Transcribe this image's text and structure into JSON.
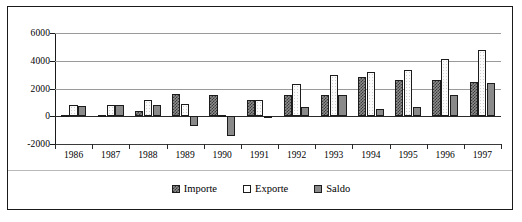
{
  "chart_data": {
    "type": "bar",
    "title": "",
    "subtitle": "",
    "xlabel": "",
    "ylabel": "",
    "ylim": [
      -2000,
      6000
    ],
    "ytick_values": [
      6000,
      4000,
      2000,
      0,
      -2000
    ],
    "ytick_labels": [
      "6000",
      "4000",
      "2000",
      "0",
      "-2000"
    ],
    "grid": true,
    "legend_position": "bottom-center",
    "categories": [
      "1986",
      "1987",
      "1988",
      "1989",
      "1990",
      "1991",
      "1992",
      "1993",
      "1994",
      "1995",
      "1996",
      "1997"
    ],
    "series": [
      {
        "name": "Importe",
        "fill": "checkered-dark",
        "color": "#8d8d8d",
        "values": [
          100,
          60,
          400,
          1600,
          1500,
          1200,
          1500,
          1500,
          2800,
          2600,
          2600,
          2500
        ]
      },
      {
        "name": "Exporte",
        "fill": "white-speckle",
        "color": "#fbfbfb",
        "values": [
          800,
          800,
          1200,
          900,
          100,
          1200,
          2300,
          3000,
          3200,
          3300,
          4100,
          4800
        ]
      },
      {
        "name": "Saldo",
        "fill": "solid-grey",
        "color": "#8a8a8a",
        "values": [
          750,
          800,
          800,
          -700,
          -1400,
          50,
          700,
          1500,
          500,
          700,
          1500,
          2400
        ]
      }
    ]
  },
  "legend": {
    "items": [
      {
        "label": "Importe",
        "swatch": "importe-swatch"
      },
      {
        "label": "Exporte",
        "swatch": "exporte-swatch"
      },
      {
        "label": "Saldo",
        "swatch": "saldo-swatch"
      }
    ]
  }
}
